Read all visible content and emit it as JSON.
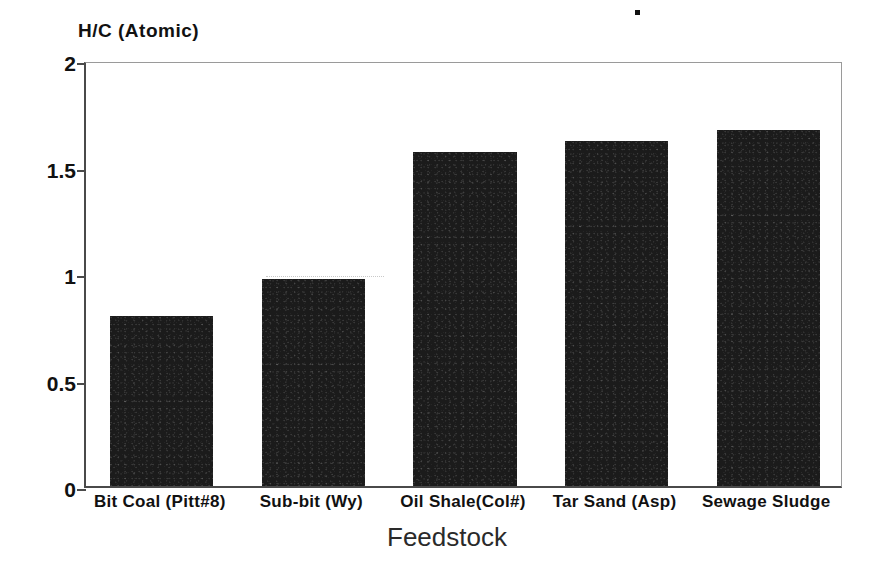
{
  "chart_data": {
    "type": "bar",
    "title": "",
    "xlabel": "Feedstock",
    "ylabel": "H/C (Atomic)",
    "categories": [
      "Bit Coal (Pitt#8)",
      "Sub-bit (Wy)",
      "Oil Shale(Col#)",
      "Tar Sand (Asp)",
      "Sewage Sludge"
    ],
    "values": [
      0.8,
      0.97,
      1.57,
      1.62,
      1.67
    ],
    "ylim": [
      0,
      2
    ],
    "yticks": [
      "0",
      "0.5",
      "1",
      "1.5",
      "2"
    ],
    "ytick_values": [
      0,
      0.5,
      1,
      1.5,
      2
    ],
    "grid": false,
    "legend": "none",
    "bar_color": "#1b1b1b",
    "axis_color": "#4a4a4a",
    "background_color": "#ffffff",
    "separator_glyph": "bullet-dot"
  }
}
